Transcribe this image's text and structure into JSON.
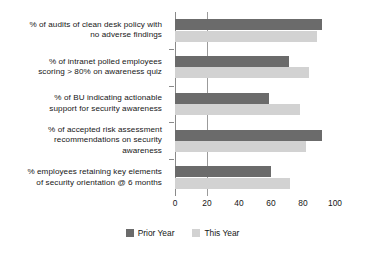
{
  "chart_data": {
    "type": "bar",
    "orientation": "horizontal",
    "title": "",
    "subtitle": "",
    "xlabel": "",
    "ylabel": "",
    "xlim": [
      0,
      100
    ],
    "xticks": [
      "0",
      "20",
      "40",
      "60",
      "80",
      "100"
    ],
    "xtick_values": [
      0,
      20,
      40,
      60,
      80,
      100
    ],
    "grid": "single vertical gridline at x = 20",
    "gridline_value": 20,
    "legend_position": "bottom-center",
    "categories": [
      "% of audits of clean desk policy with no adverse findings",
      "% of intranet polled employees scoring > 80% on awareness quiz",
      "% of BU indicating actionable support for security awareness",
      "% of accepted risk assessment recommendations on security awareness",
      "% employees retaining key elements of security orientation @ 6 months"
    ],
    "category_lines": [
      [
        "% of audits of clean desk policy with",
        "no adverse findings"
      ],
      [
        "% of intranet polled employees",
        "scoring > 80% on awareness quiz"
      ],
      [
        "% of BU indicating actionable",
        "support for security awareness"
      ],
      [
        "% of accepted risk assessment",
        "recommendations on security",
        "awareness"
      ],
      [
        "% employees retaining key elements",
        "of security orientation @ 6 months"
      ]
    ],
    "series": [
      {
        "name": "Prior Year",
        "color": "#6b6b6b",
        "values": [
          92,
          71,
          59,
          92,
          60
        ]
      },
      {
        "name": "This Year",
        "color": "#d2d2d2",
        "values": [
          89,
          84,
          78,
          82,
          72
        ]
      }
    ]
  },
  "legend": {
    "items": [
      {
        "label": "Prior Year",
        "color": "#6b6b6b"
      },
      {
        "label": "This Year",
        "color": "#d2d2d2"
      }
    ]
  },
  "colors": {
    "prior_year": "#6b6b6b",
    "this_year": "#d2d2d2",
    "axis": "#8a8a8a",
    "gridline": "#9b9b9b",
    "background": "#ffffff",
    "text": "#161616"
  }
}
